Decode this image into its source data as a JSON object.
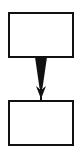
{
  "diagram": {
    "type": "flowchart",
    "nodes": [
      {
        "id": "top",
        "label": ""
      },
      {
        "id": "bottom",
        "label": ""
      }
    ],
    "edges": [
      {
        "from": "top",
        "to": "bottom",
        "style": "tapered-arrow"
      }
    ],
    "colors": {
      "stroke": "#111111",
      "fill": "#ffffff"
    }
  }
}
